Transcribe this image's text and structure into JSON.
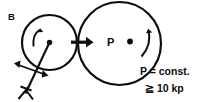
{
  "figure": {
    "panel_label": "B",
    "point_label": "P",
    "annotations": {
      "line1": "P = const.",
      "line2": "≧ 10 kp"
    },
    "colors": {
      "ink": "#0d0d0d",
      "background": "#ffffff"
    },
    "geometry": {
      "small_circle": {
        "cx": 49.5,
        "cy": 42.5,
        "r": 27.5,
        "stroke_width": 2.2
      },
      "large_circle": {
        "cx": 119.5,
        "cy": 43.5,
        "r": 41.5,
        "stroke_width": 2.2
      },
      "small_center_dot_r": 2.6,
      "large_center_dot_r": 2.8,
      "contact_arrow": {
        "x1": 72,
        "y1": 42,
        "x2": 92,
        "y2": 42
      }
    },
    "icons": {
      "small_rotation": "rotation-arrow-ccw-icon",
      "large_rotation": "rotation-arrow-cw-icon",
      "force_arrow": "force-arrow-right-icon",
      "double_arrow": "double-headed-arrow-icon",
      "support_fork": "support-fork-icon"
    }
  }
}
